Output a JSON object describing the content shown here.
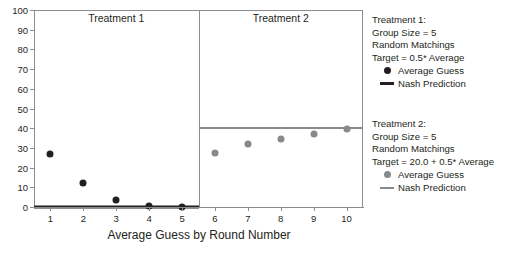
{
  "chart_data": {
    "type": "scatter",
    "title": "",
    "xlabel": "Average Guess by Round Number",
    "ylabel": "",
    "xlim": [
      0.5,
      10.5
    ],
    "ylim": [
      0,
      100
    ],
    "grid": false,
    "x": [
      1,
      2,
      3,
      4,
      5,
      6,
      7,
      8,
      9,
      10
    ],
    "panels": [
      {
        "label": "Treatment 1",
        "x_range": [
          0.5,
          5.5
        ],
        "color": "#231f20",
        "series": [
          {
            "name": "Average Guess",
            "type": "scatter",
            "x": [
              1,
              2,
              3,
              4,
              5
            ],
            "values": [
              26.8,
              12.4,
              3.6,
              0.6,
              0.2
            ]
          },
          {
            "name": "Nash Prediction",
            "type": "line",
            "x": [
              0.5,
              5.5
            ],
            "values": [
              0,
              0
            ]
          }
        ]
      },
      {
        "label": "Treatment 2",
        "x_range": [
          5.5,
          10.5
        ],
        "color": "#898989",
        "series": [
          {
            "name": "Average Guess",
            "type": "scatter",
            "x": [
              6,
              7,
              8,
              9,
              10
            ],
            "values": [
              27.4,
              32.0,
              34.6,
              37.2,
              39.4
            ]
          },
          {
            "name": "Nash Prediction",
            "type": "line",
            "x": [
              5.5,
              10.5
            ],
            "values": [
              40,
              40
            ]
          }
        ]
      }
    ],
    "yticks": [
      0,
      10,
      20,
      30,
      40,
      50,
      60,
      70,
      80,
      90,
      100
    ],
    "ytick_labels": [
      "0",
      "10",
      "20",
      "30",
      "40",
      "50",
      "60",
      "70",
      "80",
      "90",
      "100"
    ],
    "xticks": [
      1,
      2,
      3,
      4,
      5,
      6,
      7,
      8,
      9,
      10
    ],
    "xtick_labels": [
      "1",
      "2",
      "3",
      "4",
      "5",
      "6",
      "7",
      "8",
      "9",
      "10"
    ],
    "legend_position": "right"
  },
  "panels": {
    "left_title": "Treatment 1",
    "right_title": "Treatment 2"
  },
  "axis": {
    "x_title": "Average Guess by Round Number"
  },
  "legend": {
    "treatment1": {
      "line1": "Treatment 1:",
      "line2": "Group Size = 5",
      "line3": "Random Matchings",
      "line4": "Target = 0.5* Average",
      "entry_point_label": "Average Guess",
      "entry_line_label": "Nash Prediction",
      "color": "#231f20"
    },
    "treatment2": {
      "line1": "Treatment 2:",
      "line2": "Group Size = 5",
      "line3": "Random Matchings",
      "line4": "Target = 20.0 + 0.5* Average",
      "entry_point_label": "Average Guess",
      "entry_line_label": "Nash Prediction",
      "color": "#898989"
    }
  },
  "colors": {
    "treatment1": "#231f20",
    "treatment2": "#898989",
    "frame": "#8c8c8c",
    "background": "#ffffff"
  }
}
